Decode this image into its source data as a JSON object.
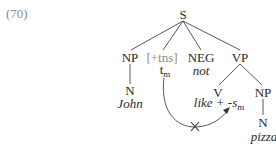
{
  "example_number": "(70)",
  "tree": {
    "root": "S",
    "subject": {
      "phrase": "NP",
      "head": "N",
      "word": "John"
    },
    "tense": {
      "feature": "[+tns]",
      "trace": "t",
      "trace_index": "m"
    },
    "negation": {
      "category": "NEG",
      "word": "not"
    },
    "vp": {
      "phrase": "VP",
      "verb": {
        "category": "V",
        "word": "like + -s",
        "affix_index": "m"
      },
      "object": {
        "phrase": "NP",
        "head": "N",
        "word": "pizza"
      }
    }
  },
  "movement_arrow": {
    "from": "t_m",
    "to": "like + -s_m",
    "blocked_mark": "×",
    "blocked": true
  },
  "colors": {
    "text": "#2a2a2a",
    "gray": "#8a8a8a",
    "line": "#444444"
  }
}
